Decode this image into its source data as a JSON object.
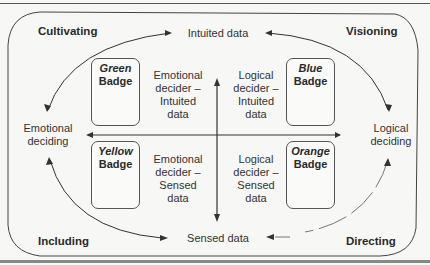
{
  "quadrants": {
    "top_left": "Cultivating",
    "top_right": "Visioning",
    "bottom_left": "Including",
    "bottom_right": "Directing"
  },
  "axes": {
    "top": "Intuited data",
    "bottom": "Sensed data",
    "left": "Emotional deciding",
    "right": "Logical deciding"
  },
  "badges": [
    {
      "color_name": "Green",
      "word": "Badge",
      "position": "top-left"
    },
    {
      "color_name": "Blue",
      "word": "Badge",
      "position": "top-right"
    },
    {
      "color_name": "Yellow",
      "word": "Badge",
      "position": "bottom-left"
    },
    {
      "color_name": "Orange",
      "word": "Badge",
      "position": "bottom-right"
    }
  ],
  "deciders": {
    "top_left": "Emotional decider – Intuited data",
    "top_right": "Logical decider – Intuited data",
    "bottom_left": "Emotional decider – Sensed data",
    "bottom_right": "Logical decider – Sensed data"
  },
  "colors": {
    "line": "#3a3a3a",
    "background": "#f7f7f5"
  }
}
